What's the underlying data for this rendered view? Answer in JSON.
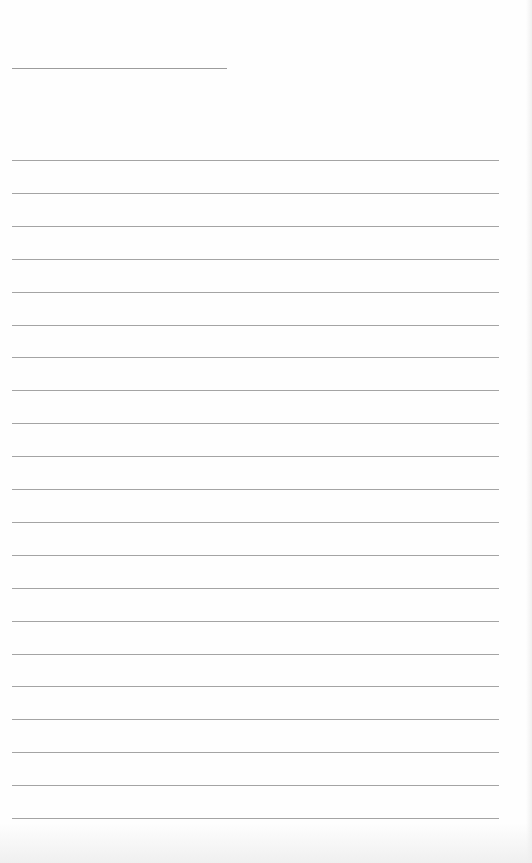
{
  "page": {
    "type": "lined-paper",
    "background_color": "#fefefe",
    "line_color": "#a4a4a4",
    "title_line": {
      "label": "",
      "top": 68,
      "left": 12,
      "width": 215
    },
    "rules": {
      "count": 21,
      "first_top": 160,
      "spacing": 32.9,
      "left": 12,
      "width": 487
    },
    "writing_lines": [
      {
        "text": ""
      },
      {
        "text": ""
      },
      {
        "text": ""
      },
      {
        "text": ""
      },
      {
        "text": ""
      },
      {
        "text": ""
      },
      {
        "text": ""
      },
      {
        "text": ""
      },
      {
        "text": ""
      },
      {
        "text": ""
      },
      {
        "text": ""
      },
      {
        "text": ""
      },
      {
        "text": ""
      },
      {
        "text": ""
      },
      {
        "text": ""
      },
      {
        "text": ""
      },
      {
        "text": ""
      },
      {
        "text": ""
      },
      {
        "text": ""
      },
      {
        "text": ""
      },
      {
        "text": ""
      }
    ]
  }
}
